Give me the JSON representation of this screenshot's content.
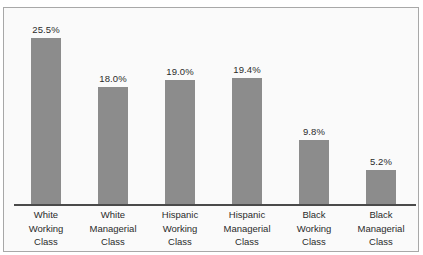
{
  "chart_data": {
    "type": "bar",
    "title": "",
    "subtitle": "",
    "xlabel": "",
    "ylabel": "",
    "ylim": [
      0,
      26
    ],
    "grid": false,
    "legend": "none",
    "value_suffix": "%",
    "categories": [
      "White Working Class",
      "White Managerial Class",
      "Hispanic Working Class",
      "Hispanic Managerial Class",
      "Black Working Class",
      "Black Managerial Class"
    ],
    "category_lines": [
      [
        "White",
        "Working",
        "Class"
      ],
      [
        "White",
        "Managerial",
        "Class"
      ],
      [
        "Hispanic",
        "Working",
        "Class"
      ],
      [
        "Hispanic",
        "Managerial",
        "Class"
      ],
      [
        "Black",
        "Working",
        "Class"
      ],
      [
        "Black",
        "Managerial",
        "Class"
      ]
    ],
    "values": [
      25.5,
      18.0,
      19.0,
      19.4,
      9.8,
      5.2
    ],
    "value_labels": [
      "25.5%",
      "18.0%",
      "19.0%",
      "19.4%",
      "9.8%",
      "5.2%"
    ],
    "colors": {
      "bar": "#8c8c8c",
      "axis": "#4a4a4a",
      "frame": "#a8a8a8",
      "background": "#fafafa",
      "text": "#2b2b2b"
    }
  }
}
